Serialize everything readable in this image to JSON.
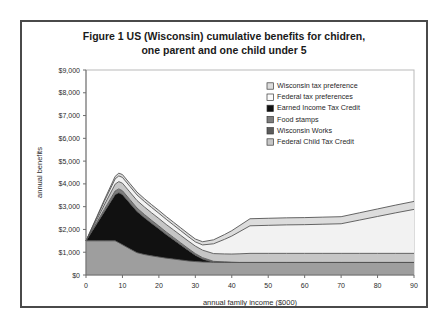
{
  "figure": {
    "title_line_1": "Figure 1  US (Wisconsin) cumulative benefits for chidren,",
    "title_line_2": "one parent and one child under 5"
  },
  "chart_data": {
    "type": "area",
    "stacked": true,
    "title": "Figure 1  US (Wisconsin) cumulative benefits for chidren, one parent and one child under 5",
    "xlabel": "annual family income ($000)",
    "ylabel": "annual benefits",
    "xlim": [
      0,
      90
    ],
    "ylim": [
      0,
      9000
    ],
    "xticks": [
      0,
      10,
      20,
      30,
      40,
      50,
      60,
      70,
      80,
      90
    ],
    "xtick_labels": [
      "0",
      "10",
      "20",
      "30",
      "40",
      "50",
      "60",
      "70",
      "80",
      "90"
    ],
    "yticks": [
      0,
      1000,
      2000,
      3000,
      4000,
      5000,
      6000,
      7000,
      8000,
      9000
    ],
    "ytick_labels": [
      "$0",
      "$1,000",
      "$2,000",
      "$3,000",
      "$4,000",
      "$5,000",
      "$6,000",
      "$7,000",
      "$8,000",
      "$9,000"
    ],
    "grid": false,
    "legend_position": "right-upper",
    "x": [
      0,
      3,
      5,
      8,
      9,
      10,
      12,
      14,
      16,
      18,
      20,
      22,
      24,
      26,
      28,
      30,
      32,
      35,
      38,
      40,
      42,
      45,
      50,
      55,
      60,
      65,
      70,
      75,
      80,
      85,
      90
    ],
    "series": [
      {
        "name": "Wisconsin Works",
        "color": "#9e9e9e",
        "values": [
          1500,
          1500,
          1500,
          1500,
          1420,
          1330,
          1150,
          980,
          900,
          840,
          790,
          740,
          700,
          660,
          620,
          590,
          570,
          560,
          555,
          550,
          550,
          550,
          550,
          550,
          550,
          550,
          550,
          550,
          550,
          550,
          550
        ]
      },
      {
        "name": "Earned Income Tax Credit",
        "color": "#111111",
        "values": [
          0,
          760,
          1270,
          2030,
          2190,
          2200,
          2010,
          1810,
          1620,
          1430,
          1240,
          1040,
          850,
          660,
          470,
          280,
          130,
          0,
          0,
          0,
          0,
          0,
          0,
          0,
          0,
          0,
          0,
          0,
          0,
          0,
          0
        ]
      },
      {
        "name": "Food stamps",
        "color": "#7d7d7d",
        "values": [
          0,
          60,
          100,
          160,
          170,
          170,
          160,
          150,
          140,
          130,
          120,
          110,
          100,
          90,
          80,
          70,
          60,
          40,
          20,
          10,
          0,
          0,
          0,
          0,
          0,
          0,
          0,
          0,
          0,
          0,
          0
        ]
      },
      {
        "name": "Federal Child Tax Credit",
        "color": "#c6c6c6",
        "values": [
          0,
          120,
          200,
          300,
          320,
          330,
          330,
          330,
          330,
          330,
          330,
          330,
          330,
          330,
          330,
          330,
          330,
          340,
          350,
          360,
          380,
          400,
          400,
          400,
          400,
          400,
          400,
          400,
          400,
          400,
          400
        ]
      },
      {
        "name": "Federal tax preferences",
        "color": "#f2f2f2",
        "values": [
          0,
          90,
          150,
          230,
          250,
          255,
          250,
          245,
          240,
          235,
          230,
          225,
          215,
          205,
          195,
          185,
          230,
          430,
          640,
          790,
          960,
          1210,
          1230,
          1250,
          1260,
          1280,
          1300,
          1460,
          1620,
          1780,
          1930
        ]
      },
      {
        "name": "Wisconsin tax preference",
        "color": "#dcdcdc",
        "values": [
          0,
          40,
          70,
          110,
          120,
          125,
          125,
          125,
          125,
          125,
          125,
          125,
          125,
          125,
          125,
          125,
          140,
          175,
          210,
          235,
          265,
          310,
          310,
          310,
          310,
          310,
          310,
          320,
          330,
          340,
          350
        ]
      }
    ],
    "legend_entries": [
      {
        "label": "Wisconsin tax preference",
        "color": "#dcdcdc"
      },
      {
        "label": "Federal tax preferences",
        "color": "#fbfbfb"
      },
      {
        "label": "Earned Income Tax Credit",
        "color": "#111111"
      },
      {
        "label": "Food stamps",
        "color": "#7d7d7d"
      },
      {
        "label": "Wisconsin Works",
        "color": "#5c5c5c"
      },
      {
        "label": "Federal Child Tax Credit",
        "color": "#c6c6c6"
      }
    ]
  }
}
